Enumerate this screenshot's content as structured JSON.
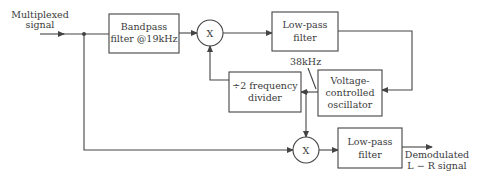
{
  "diagram": {
    "input_label": [
      "Multiplexed",
      "signal"
    ],
    "bandpass_filter": [
      "Bandpass",
      "filter @19kHz"
    ],
    "mixer_top": "X",
    "lowpass_top": [
      "Low-pass",
      "filter"
    ],
    "freq_label": "38kHz",
    "vco": [
      "Voltage-",
      "controlled",
      "oscillator"
    ],
    "divider": [
      "÷2 frequency",
      "divider"
    ],
    "mixer_bottom": "X",
    "lowpass_bottom": [
      "Low-pass",
      "filter"
    ],
    "output_label": [
      "Demodulated",
      "L − R  signal"
    ]
  },
  "colors": {
    "stroke": "#444444",
    "text": "#3a3a3a",
    "background": "#ffffff"
  }
}
